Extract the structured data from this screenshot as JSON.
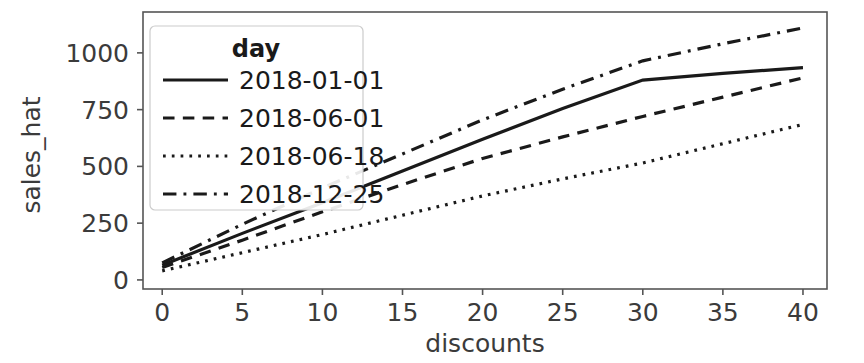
{
  "chart_data": {
    "type": "line",
    "title": "",
    "xlabel": "discounts",
    "ylabel": "sales_hat",
    "xlim": [
      -1.2,
      41.5
    ],
    "ylim": [
      -40,
      1180
    ],
    "xticks": [
      0,
      5,
      10,
      15,
      20,
      25,
      30,
      35,
      40
    ],
    "xtick_labels": [
      "0",
      "5",
      "10",
      "15",
      "20",
      "25",
      "30",
      "35",
      "40"
    ],
    "yticks": [
      0,
      250,
      500,
      750,
      1000
    ],
    "ytick_labels": [
      "0",
      "250",
      "500",
      "750",
      "1000"
    ],
    "grid": false,
    "legend": {
      "title": "day",
      "position": "upper-left",
      "entries": [
        {
          "label": "2018-01-01",
          "style": "solid"
        },
        {
          "label": "2018-06-01",
          "style": "dashed"
        },
        {
          "label": "2018-06-18",
          "style": "dotted"
        },
        {
          "label": "2018-12-25",
          "style": "dashdot"
        }
      ]
    },
    "x": [
      0,
      5,
      10,
      15,
      20,
      25,
      30,
      35,
      40
    ],
    "series": [
      {
        "name": "2018-01-01",
        "style": "solid",
        "color": "#1a1a1a",
        "values": [
          65,
          205,
          340,
          480,
          620,
          755,
          880,
          910,
          935
        ]
      },
      {
        "name": "2018-06-01",
        "style": "dashed",
        "color": "#1a1a1a",
        "values": [
          55,
          175,
          300,
          420,
          535,
          630,
          720,
          805,
          890
        ]
      },
      {
        "name": "2018-06-18",
        "style": "dotted",
        "color": "#1a1a1a",
        "values": [
          40,
          120,
          200,
          285,
          370,
          445,
          515,
          600,
          685
        ]
      },
      {
        "name": "2018-12-25",
        "style": "dashdot",
        "color": "#1a1a1a",
        "values": [
          75,
          245,
          405,
          555,
          705,
          840,
          965,
          1040,
          1110
        ]
      }
    ]
  },
  "colors": {
    "line": "#1a1a1a",
    "axis": "#555555",
    "legend_border": "#cccccc",
    "background": "#ffffff"
  }
}
